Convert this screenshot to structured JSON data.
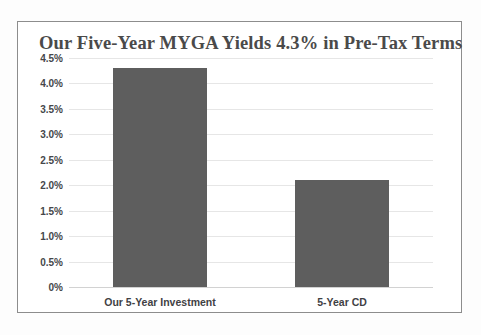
{
  "chart_data": {
    "type": "bar",
    "title": "Our Five-Year MYGA Yields 4.3% in Pre-Tax Terms",
    "xlabel": "",
    "ylabel": "",
    "categories": [
      "Our 5-Year Investment",
      "5-Year CD"
    ],
    "values": [
      4.3,
      2.1
    ],
    "value_unit": "%",
    "ylim": [
      0,
      4.5
    ],
    "ytick_values": [
      0,
      0.5,
      1.0,
      1.5,
      2.0,
      2.5,
      3.0,
      3.5,
      4.0,
      4.5
    ],
    "ytick_labels": [
      "0%",
      "0.5%",
      "1.0%",
      "1.5%",
      "2.0%",
      "2.5%",
      "3.0%",
      "3.5%",
      "4.0%",
      "4.5%"
    ],
    "grid": true,
    "legend": false,
    "legend_position": "none",
    "series": [
      {
        "name": "Yield",
        "values": [
          4.3,
          2.1
        ],
        "color": "#5e5e5e"
      }
    ],
    "colors": {
      "bar": "#5e5e5e",
      "gridline": "#e6e6e6",
      "baseline": "#d2d2d2",
      "border": "#8d8d8d",
      "title_text": "#4a4a4a",
      "axis_text": "#45474a",
      "plot_background": "#ffffff",
      "page_background": "#fdfdfd"
    }
  }
}
